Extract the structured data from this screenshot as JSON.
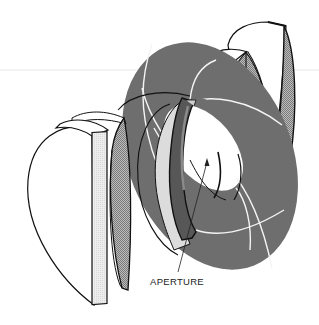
{
  "figure": {
    "type": "exploded technical illustration",
    "labels": [
      {
        "id": "aperture",
        "text": "APERTURE",
        "x": 150,
        "y": 276
      }
    ]
  },
  "colors": {
    "background": "#ffffff",
    "iris_gray": "#6e6e6e",
    "line": "#111111",
    "hatch_light": "#c8c8c8",
    "hatch_dark": "#9a9a9a",
    "blade_dark": "#5a5a5a",
    "guide_line": "#e6e6e6"
  }
}
